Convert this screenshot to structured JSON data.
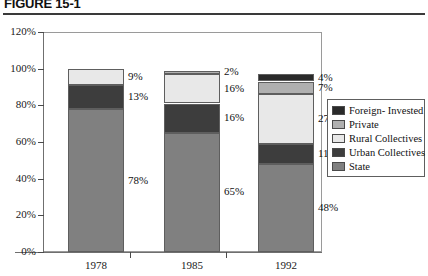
{
  "figure": {
    "title": "FIGURE 15-1"
  },
  "chart_data": {
    "type": "bar",
    "subtype": "stacked-percent",
    "title": "FIGURE 15-1",
    "xlabel": "",
    "ylabel": "",
    "ylim": [
      0,
      120
    ],
    "ytick_labels": [
      "0%",
      "20%",
      "40%",
      "60%",
      "80%",
      "100%",
      "120%"
    ],
    "ytick_values": [
      0,
      20,
      40,
      60,
      80,
      100,
      120
    ],
    "grid": false,
    "legend_position": "right",
    "categories": [
      "1978",
      "1985",
      "1992"
    ],
    "series": [
      {
        "name": "State",
        "color": "#808080",
        "values": [
          78,
          65,
          48
        ],
        "labels": [
          "78%",
          "65%",
          "48%"
        ]
      },
      {
        "name": "Urban Collectives",
        "color": "#3d3d3d",
        "values": [
          13,
          16,
          11
        ],
        "labels": [
          "13%",
          "16%",
          "11%"
        ]
      },
      {
        "name": "Rural Collectives",
        "color": "#e8e8e8",
        "values": [
          9,
          16,
          27
        ],
        "labels": [
          "9%",
          "16%",
          "27%"
        ]
      },
      {
        "name": "Private",
        "color": "#b0b0b0",
        "values": [
          0,
          2,
          7
        ],
        "labels": [
          "",
          "2%",
          "7%"
        ]
      },
      {
        "name": "Foreign- Invested",
        "color": "#2a2a2a",
        "values": [
          0,
          0,
          4
        ],
        "labels": [
          "",
          "",
          "4%"
        ]
      }
    ]
  },
  "legend": {
    "items": [
      {
        "label": "Foreign- Invested",
        "color": "#2a2a2a"
      },
      {
        "label": "Private",
        "color": "#b0b0b0"
      },
      {
        "label": "Rural Collectives",
        "color": "#e8e8e8"
      },
      {
        "label": "Urban Collectives",
        "color": "#3d3d3d"
      },
      {
        "label": "State",
        "color": "#808080"
      }
    ]
  }
}
